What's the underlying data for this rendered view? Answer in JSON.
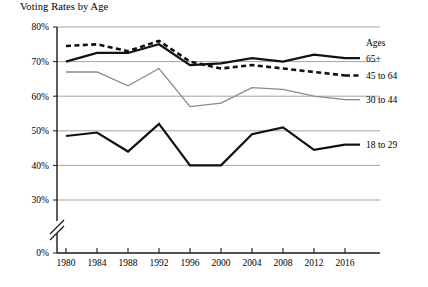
{
  "chart_data": {
    "type": "line",
    "title": "Voting Rates by Age",
    "xlabel": "",
    "ylabel": "",
    "grid": true,
    "legend_position": "right",
    "legend_title": "Ages",
    "axis_break": true,
    "axis_break_note": "y-axis broken between 0% and 30%",
    "categories": [
      1980,
      1984,
      1988,
      1992,
      1996,
      2000,
      2004,
      2008,
      2012,
      2016
    ],
    "x_tick_labels": [
      "1980",
      "1984",
      "1988",
      "1992",
      "1996",
      "2000",
      "2004",
      "2008",
      "2012",
      "2016"
    ],
    "y_tick_labels": [
      "0%",
      "30%",
      "40%",
      "50%",
      "60%",
      "70%",
      "80%"
    ],
    "y_tick_values": [
      0,
      30,
      40,
      50,
      60,
      70,
      80
    ],
    "ylim": [
      30,
      80
    ],
    "series": [
      {
        "name": "65+",
        "style": "solid-black",
        "color": "#111111",
        "values": [
          70,
          72.5,
          72.5,
          75,
          69,
          69.5,
          71,
          70,
          72,
          71
        ]
      },
      {
        "name": "45 to 64",
        "style": "dashed-black",
        "color": "#111111",
        "values": [
          74.5,
          75,
          73,
          76,
          70,
          68,
          69,
          68,
          67,
          66
        ]
      },
      {
        "name": "30 to 44",
        "style": "solid-gray",
        "color": "#8a8a8a",
        "values": [
          67,
          67,
          63,
          68,
          57,
          58,
          62.5,
          62,
          60,
          59
        ]
      },
      {
        "name": "18 to 29",
        "style": "solid-black",
        "color": "#111111",
        "values": [
          48.5,
          49.5,
          44,
          52,
          40,
          40,
          49,
          51,
          44.5,
          46
        ]
      }
    ]
  },
  "legend": {
    "title": "Ages",
    "entries": [
      {
        "label": "65+"
      },
      {
        "label": "45 to 64"
      },
      {
        "label": "30 to 44"
      },
      {
        "label": "18 to 29"
      }
    ]
  },
  "colors": {
    "gridline": "#9b9b9b",
    "axis": "#1a1a1a",
    "dark_series": "#111111",
    "gray_series": "#8a8a8a",
    "background": "#ffffff"
  }
}
